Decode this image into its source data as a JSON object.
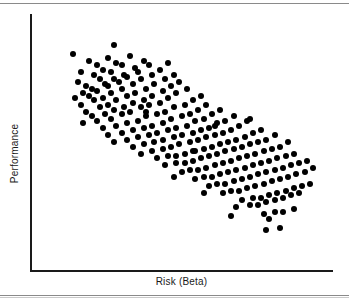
{
  "figure": {
    "background_color": "#ffffff",
    "rule_color": "#8a8a8a",
    "axis_color": "#1a1a1a",
    "point_color": "#000000"
  },
  "chart_data": {
    "type": "scatter",
    "title": "",
    "xlabel": "Risk (Beta)",
    "ylabel": "Performance",
    "grid": false,
    "legend": null,
    "xticks": [],
    "yticks": [],
    "xlim": [
      0,
      100
    ],
    "ylim": [
      0,
      100
    ],
    "marker": "filled-circle",
    "marker_size_px": 6,
    "relationship": "strong negative correlation",
    "n_points": 224,
    "points": [
      [
        9,
        88
      ],
      [
        15,
        85
      ],
      [
        24,
        92
      ],
      [
        12,
        80
      ],
      [
        18,
        83
      ],
      [
        22,
        86
      ],
      [
        11,
        76
      ],
      [
        17,
        79
      ],
      [
        20,
        81
      ],
      [
        25,
        84
      ],
      [
        14,
        74
      ],
      [
        19,
        77
      ],
      [
        23,
        80
      ],
      [
        27,
        83
      ],
      [
        30,
        87
      ],
      [
        13,
        71
      ],
      [
        16,
        73
      ],
      [
        21,
        75
      ],
      [
        24,
        77
      ],
      [
        28,
        79
      ],
      [
        32,
        82
      ],
      [
        35,
        85
      ],
      [
        10,
        69
      ],
      [
        15,
        70
      ],
      [
        18,
        72
      ],
      [
        22,
        74
      ],
      [
        26,
        76
      ],
      [
        29,
        78
      ],
      [
        33,
        80
      ],
      [
        37,
        83
      ],
      [
        12,
        66
      ],
      [
        17,
        68
      ],
      [
        20,
        69
      ],
      [
        23,
        71
      ],
      [
        27,
        73
      ],
      [
        31,
        75
      ],
      [
        34,
        77
      ],
      [
        38,
        79
      ],
      [
        41,
        81
      ],
      [
        44,
        84
      ],
      [
        14,
        63
      ],
      [
        19,
        65
      ],
      [
        22,
        66
      ],
      [
        25,
        68
      ],
      [
        29,
        70
      ],
      [
        32,
        71
      ],
      [
        36,
        73
      ],
      [
        39,
        75
      ],
      [
        43,
        77
      ],
      [
        46,
        79
      ],
      [
        16,
        61
      ],
      [
        21,
        62
      ],
      [
        24,
        64
      ],
      [
        28,
        65
      ],
      [
        31,
        67
      ],
      [
        35,
        68
      ],
      [
        38,
        70
      ],
      [
        42,
        72
      ],
      [
        45,
        74
      ],
      [
        48,
        76
      ],
      [
        13,
        58
      ],
      [
        18,
        59
      ],
      [
        23,
        60
      ],
      [
        27,
        62
      ],
      [
        30,
        63
      ],
      [
        34,
        65
      ],
      [
        37,
        66
      ],
      [
        41,
        67
      ],
      [
        44,
        69
      ],
      [
        47,
        71
      ],
      [
        51,
        73
      ],
      [
        20,
        56
      ],
      [
        25,
        57
      ],
      [
        29,
        58
      ],
      [
        33,
        59
      ],
      [
        36,
        61
      ],
      [
        40,
        62
      ],
      [
        43,
        63
      ],
      [
        46,
        65
      ],
      [
        50,
        66
      ],
      [
        53,
        68
      ],
      [
        56,
        70
      ],
      [
        22,
        53
      ],
      [
        27,
        54
      ],
      [
        31,
        55
      ],
      [
        35,
        56
      ],
      [
        38,
        57
      ],
      [
        42,
        58
      ],
      [
        45,
        60
      ],
      [
        49,
        61
      ],
      [
        52,
        62
      ],
      [
        55,
        64
      ],
      [
        58,
        66
      ],
      [
        24,
        50
      ],
      [
        29,
        51
      ],
      [
        33,
        52
      ],
      [
        37,
        53
      ],
      [
        40,
        54
      ],
      [
        44,
        55
      ],
      [
        47,
        56
      ],
      [
        51,
        57
      ],
      [
        54,
        59
      ],
      [
        57,
        60
      ],
      [
        60,
        62
      ],
      [
        63,
        64
      ],
      [
        31,
        48
      ],
      [
        35,
        49
      ],
      [
        39,
        50
      ],
      [
        42,
        51
      ],
      [
        46,
        52
      ],
      [
        49,
        53
      ],
      [
        53,
        54
      ],
      [
        56,
        55
      ],
      [
        59,
        56
      ],
      [
        62,
        58
      ],
      [
        65,
        59
      ],
      [
        68,
        61
      ],
      [
        34,
        45
      ],
      [
        38,
        46
      ],
      [
        42,
        47
      ],
      [
        45,
        48
      ],
      [
        48,
        49
      ],
      [
        52,
        50
      ],
      [
        55,
        51
      ],
      [
        58,
        52
      ],
      [
        61,
        53
      ],
      [
        64,
        54
      ],
      [
        67,
        55
      ],
      [
        70,
        57
      ],
      [
        73,
        59
      ],
      [
        40,
        43
      ],
      [
        44,
        44
      ],
      [
        47,
        44
      ],
      [
        50,
        45
      ],
      [
        54,
        46
      ],
      [
        57,
        47
      ],
      [
        60,
        48
      ],
      [
        63,
        49
      ],
      [
        66,
        50
      ],
      [
        69,
        51
      ],
      [
        72,
        52
      ],
      [
        75,
        54
      ],
      [
        78,
        55
      ],
      [
        43,
        40
      ],
      [
        47,
        41
      ],
      [
        50,
        41
      ],
      [
        53,
        42
      ],
      [
        56,
        43
      ],
      [
        59,
        44
      ],
      [
        62,
        45
      ],
      [
        65,
        46
      ],
      [
        68,
        47
      ],
      [
        71,
        48
      ],
      [
        74,
        49
      ],
      [
        77,
        50
      ],
      [
        80,
        51
      ],
      [
        83,
        53
      ],
      [
        49,
        37
      ],
      [
        52,
        38
      ],
      [
        55,
        38
      ],
      [
        58,
        39
      ],
      [
        61,
        40
      ],
      [
        64,
        41
      ],
      [
        67,
        42
      ],
      [
        70,
        43
      ],
      [
        73,
        44
      ],
      [
        76,
        45
      ],
      [
        79,
        46
      ],
      [
        82,
        47
      ],
      [
        85,
        48
      ],
      [
        88,
        50
      ],
      [
        54,
        34
      ],
      [
        57,
        35
      ],
      [
        60,
        35
      ],
      [
        63,
        36
      ],
      [
        66,
        37
      ],
      [
        69,
        38
      ],
      [
        72,
        39
      ],
      [
        75,
        40
      ],
      [
        78,
        41
      ],
      [
        81,
        42
      ],
      [
        84,
        43
      ],
      [
        87,
        44
      ],
      [
        90,
        45
      ],
      [
        59,
        31
      ],
      [
        62,
        32
      ],
      [
        65,
        32
      ],
      [
        68,
        33
      ],
      [
        71,
        34
      ],
      [
        74,
        35
      ],
      [
        77,
        36
      ],
      [
        80,
        37
      ],
      [
        83,
        38
      ],
      [
        86,
        39
      ],
      [
        89,
        40
      ],
      [
        92,
        41
      ],
      [
        95,
        42
      ],
      [
        64,
        28
      ],
      [
        67,
        29
      ],
      [
        70,
        29
      ],
      [
        73,
        30
      ],
      [
        76,
        31
      ],
      [
        79,
        32
      ],
      [
        82,
        33
      ],
      [
        85,
        34
      ],
      [
        88,
        35
      ],
      [
        91,
        36
      ],
      [
        94,
        37
      ],
      [
        97,
        39
      ],
      [
        71,
        25
      ],
      [
        75,
        26
      ],
      [
        78,
        26
      ],
      [
        81,
        27
      ],
      [
        84,
        28
      ],
      [
        87,
        29
      ],
      [
        90,
        30
      ],
      [
        93,
        31
      ],
      [
        96,
        32
      ],
      [
        69,
        22
      ],
      [
        74,
        23
      ],
      [
        77,
        23
      ],
      [
        80,
        24
      ],
      [
        83,
        25
      ],
      [
        86,
        26
      ],
      [
        89,
        27
      ],
      [
        92,
        28
      ],
      [
        79,
        19
      ],
      [
        83,
        20
      ],
      [
        86,
        20
      ],
      [
        90,
        21
      ],
      [
        53,
        46
      ],
      [
        61,
        57
      ],
      [
        74,
        60
      ],
      [
        57,
        28
      ],
      [
        67,
        18
      ],
      [
        81,
        17
      ],
      [
        80,
        12
      ],
      [
        85,
        13
      ],
      [
        46,
        35
      ],
      [
        36,
        63
      ]
    ]
  }
}
